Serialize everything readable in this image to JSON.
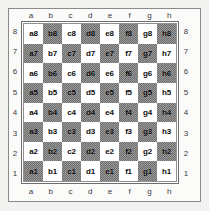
{
  "diagram": {
    "type": "chessboard-coordinates",
    "files": [
      "a",
      "b",
      "c",
      "d",
      "e",
      "f",
      "g",
      "h"
    ],
    "ranks": [
      "8",
      "7",
      "6",
      "5",
      "4",
      "3",
      "2",
      "1"
    ],
    "colors": {
      "light_square": "#ffffff",
      "dark_square": "#8c8c8c",
      "border": "#6d6d6d",
      "text": "#0d0d0d",
      "coordinate_text": "#3a3a3a",
      "page_background": "#f2f2f0"
    },
    "rows": [
      {
        "rank": "8",
        "squares": [
          {
            "name": "a8",
            "shade": "light"
          },
          {
            "name": "b8",
            "shade": "dark"
          },
          {
            "name": "c8",
            "shade": "light"
          },
          {
            "name": "d8",
            "shade": "dark"
          },
          {
            "name": "e8",
            "shade": "light"
          },
          {
            "name": "f8",
            "shade": "dark"
          },
          {
            "name": "g8",
            "shade": "light"
          },
          {
            "name": "h8",
            "shade": "dark"
          }
        ]
      },
      {
        "rank": "7",
        "squares": [
          {
            "name": "a7",
            "shade": "dark"
          },
          {
            "name": "b7",
            "shade": "light"
          },
          {
            "name": "c7",
            "shade": "dark"
          },
          {
            "name": "d7",
            "shade": "light"
          },
          {
            "name": "e7",
            "shade": "dark"
          },
          {
            "name": "f7",
            "shade": "light"
          },
          {
            "name": "g7",
            "shade": "dark"
          },
          {
            "name": "h7",
            "shade": "light"
          }
        ]
      },
      {
        "rank": "6",
        "squares": [
          {
            "name": "a6",
            "shade": "light"
          },
          {
            "name": "b6",
            "shade": "dark"
          },
          {
            "name": "c6",
            "shade": "light"
          },
          {
            "name": "d6",
            "shade": "dark"
          },
          {
            "name": "e6",
            "shade": "light"
          },
          {
            "name": "f6",
            "shade": "dark"
          },
          {
            "name": "g6",
            "shade": "light"
          },
          {
            "name": "h6",
            "shade": "dark"
          }
        ]
      },
      {
        "rank": "5",
        "squares": [
          {
            "name": "a5",
            "shade": "dark"
          },
          {
            "name": "b5",
            "shade": "light"
          },
          {
            "name": "c5",
            "shade": "dark"
          },
          {
            "name": "d5",
            "shade": "light"
          },
          {
            "name": "e5",
            "shade": "dark"
          },
          {
            "name": "f5",
            "shade": "light"
          },
          {
            "name": "g5",
            "shade": "dark"
          },
          {
            "name": "h5",
            "shade": "light"
          }
        ]
      },
      {
        "rank": "4",
        "squares": [
          {
            "name": "a4",
            "shade": "light"
          },
          {
            "name": "b4",
            "shade": "dark"
          },
          {
            "name": "c4",
            "shade": "light"
          },
          {
            "name": "d4",
            "shade": "dark"
          },
          {
            "name": "e4",
            "shade": "light"
          },
          {
            "name": "f4",
            "shade": "dark"
          },
          {
            "name": "g4",
            "shade": "light"
          },
          {
            "name": "h4",
            "shade": "dark"
          }
        ]
      },
      {
        "rank": "3",
        "squares": [
          {
            "name": "a3",
            "shade": "dark"
          },
          {
            "name": "b3",
            "shade": "light"
          },
          {
            "name": "c3",
            "shade": "dark"
          },
          {
            "name": "d3",
            "shade": "light"
          },
          {
            "name": "e3",
            "shade": "dark"
          },
          {
            "name": "f3",
            "shade": "light"
          },
          {
            "name": "g3",
            "shade": "dark"
          },
          {
            "name": "h3",
            "shade": "light"
          }
        ]
      },
      {
        "rank": "2",
        "squares": [
          {
            "name": "a2",
            "shade": "light"
          },
          {
            "name": "b2",
            "shade": "dark"
          },
          {
            "name": "c2",
            "shade": "light"
          },
          {
            "name": "d2",
            "shade": "dark"
          },
          {
            "name": "e2",
            "shade": "light"
          },
          {
            "name": "f2",
            "shade": "dark"
          },
          {
            "name": "g2",
            "shade": "light"
          },
          {
            "name": "h2",
            "shade": "dark"
          }
        ]
      },
      {
        "rank": "1",
        "squares": [
          {
            "name": "a1",
            "shade": "dark"
          },
          {
            "name": "b1",
            "shade": "light"
          },
          {
            "name": "c1",
            "shade": "dark"
          },
          {
            "name": "d1",
            "shade": "light"
          },
          {
            "name": "e1",
            "shade": "dark"
          },
          {
            "name": "f1",
            "shade": "light"
          },
          {
            "name": "g1",
            "shade": "dark"
          },
          {
            "name": "h1",
            "shade": "light"
          }
        ]
      }
    ]
  }
}
